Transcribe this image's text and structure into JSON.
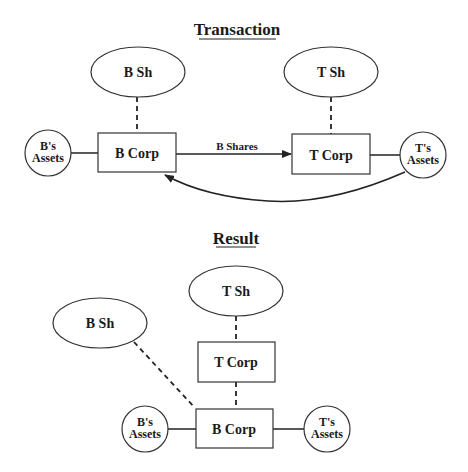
{
  "transaction": {
    "title": "Transaction",
    "b_sh": "B Sh",
    "t_sh": "T Sh",
    "b_corp": "B Corp",
    "t_corp": "T Corp",
    "b_assets_line1": "B's",
    "b_assets_line2": "Assets",
    "t_assets_line1": "T's",
    "t_assets_line2": "Assets",
    "edge_label": "B Shares"
  },
  "result": {
    "title": "Result",
    "t_sh": "T Sh",
    "b_sh": "B Sh",
    "t_corp": "T Corp",
    "b_corp": "B Corp",
    "b_assets_line1": "B's",
    "b_assets_line2": "Assets",
    "t_assets_line1": "T's",
    "t_assets_line2": "Assets"
  }
}
